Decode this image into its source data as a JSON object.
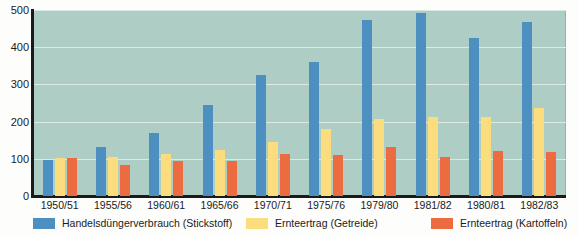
{
  "chart_data": {
    "type": "bar",
    "title": "",
    "subtitle": "",
    "xlabel": "",
    "ylabel": "",
    "ylim": [
      0,
      500
    ],
    "yticks": [
      0,
      100,
      200,
      300,
      400,
      500
    ],
    "grid": true,
    "legend_position": "bottom",
    "categories": [
      "1950/51",
      "1955/56",
      "1960/61",
      "1965/66",
      "1970/71",
      "1975/76",
      "1979/80",
      "1981/82",
      "1980/81",
      "1982/83"
    ],
    "series": [
      {
        "name": "Handelsdüngerverbrauch (Stickstoff)",
        "color": "#4d8fc0",
        "values": [
          97,
          131,
          169,
          244,
          326,
          360,
          472,
          491,
          424,
          469
        ]
      },
      {
        "name": "Ernteertrag (Getreide)",
        "color": "#fbdd7e",
        "values": [
          103,
          104,
          112,
          124,
          144,
          179,
          208,
          213,
          212,
          237
        ]
      },
      {
        "name": "Ernteertrag (Kartoffeln)",
        "color": "#ed6b41",
        "values": [
          102,
          84,
          95,
          93,
          113,
          111,
          131,
          104,
          121,
          117
        ]
      }
    ]
  },
  "plot": {
    "background_color": "#aecdc4",
    "gridline_color": "#e4efea",
    "axis_color": "#1a1a1a"
  }
}
